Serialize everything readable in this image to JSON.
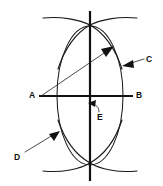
{
  "figure": {
    "kind": "geometric-construction-diagram",
    "canvas": {
      "width": 163,
      "height": 186
    },
    "background_color": "#ffffff",
    "ink_color": "#111111"
  },
  "labels": {
    "a": "A",
    "b": "B",
    "c": "C",
    "d": "D",
    "e": "E"
  },
  "label_positions": {
    "a": {
      "x": 29,
      "y": 91
    },
    "b": {
      "x": 136,
      "y": 91
    },
    "c": {
      "x": 146,
      "y": 56
    },
    "d": {
      "x": 14,
      "y": 153
    },
    "e": {
      "x": 97,
      "y": 113
    }
  },
  "geometry": {
    "ellipse": {
      "cx": 90,
      "cy": 96,
      "rx": 33,
      "ry": 71
    },
    "vertical_axis": {
      "x": 90,
      "y1": 12,
      "y2": 180
    },
    "horizontal_axis": {
      "y": 96,
      "x1": 38,
      "x2": 133
    },
    "top_intersection": {
      "x": 90,
      "y": 25
    },
    "bottom_intersection": {
      "x": 90,
      "y": 163
    },
    "arc_left": {
      "d": "M 44 19 Q 72 17 90 25 Q 112 37 124 69"
    },
    "arc_right": {
      "d": "M 136 19 Q 108 17 90 25 Q 68 37 56 69"
    },
    "arc_lower_left": {
      "d": "M 44 170 Q 72 172 90 163 Q 112 151 124 122"
    },
    "arc_lower_right": {
      "d": "M 136 170 Q 108 172 90 163 Q 68 151 56 122"
    },
    "radius_arrow": {
      "x1": 41,
      "y1": 96,
      "x2": 113,
      "y2": 47
    },
    "leader_c": {
      "x1": 144,
      "y1": 58,
      "x2": 122,
      "y2": 66
    },
    "leader_d": {
      "x1": 24,
      "y1": 152,
      "x2": 59,
      "y2": 131
    },
    "leader_e": {
      "x1": 98,
      "y1": 112,
      "x2": 89,
      "y2": 104
    }
  }
}
